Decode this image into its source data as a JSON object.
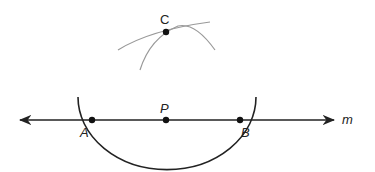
{
  "diagram": {
    "line_label": "m",
    "points": [
      {
        "id": "A",
        "label": "A",
        "x": 92,
        "y": 120
      },
      {
        "id": "P",
        "label": "P",
        "x": 166,
        "y": 120
      },
      {
        "id": "B",
        "label": "B",
        "x": 240,
        "y": 120
      },
      {
        "id": "C",
        "label": "C",
        "x": 166,
        "y": 32
      }
    ],
    "colors": {
      "main_stroke": "#222222",
      "construction_arc": "#999999",
      "background": "#ffffff"
    }
  }
}
